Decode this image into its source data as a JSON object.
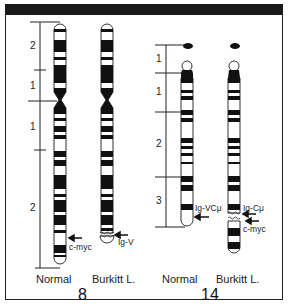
{
  "chromosome_8": {
    "number_label": "8",
    "normal_label": "Normal",
    "burkitt_label": "Burkitt L.",
    "regions": [
      "2",
      "1",
      "1",
      "2"
    ],
    "genes": {
      "normal": "c-myc",
      "burkitt": "Ig-V"
    }
  },
  "chromosome_14": {
    "number_label": "14",
    "normal_label": "Normal",
    "burkitt_label": "Burkitt L.",
    "regions": [
      "1",
      "1",
      "2",
      "3"
    ],
    "genes": {
      "normal": "Ig-VCμ",
      "burkitt_upper": "Ig-Cμ",
      "burkitt_lower": "c-myc"
    }
  },
  "colors": {
    "band": "#111111",
    "outline": "#333333",
    "background": "#ffffff"
  }
}
